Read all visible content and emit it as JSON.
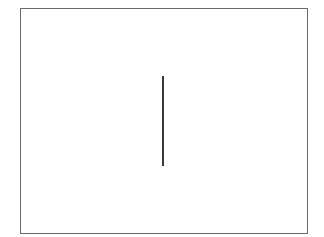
{
  "canvas": {
    "width": 324,
    "height": 237,
    "background": "#ffffff"
  },
  "frame": {
    "x": 20,
    "y": 8,
    "width": 288,
    "height": 226,
    "border_color": "#6a6a6a"
  },
  "shapes": [
    {
      "type": "vertical-line",
      "x": 163,
      "y1": 76,
      "y2": 166,
      "color": "#3a3a3a",
      "stroke_width": 2
    }
  ]
}
